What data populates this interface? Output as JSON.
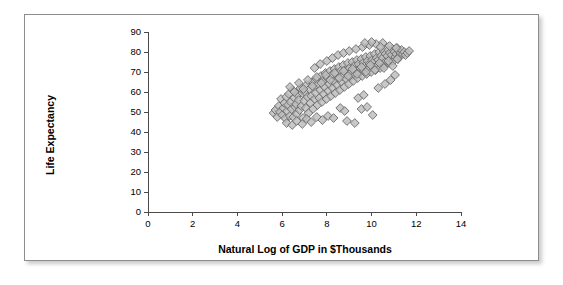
{
  "chart_data": {
    "type": "scatter",
    "title": "",
    "xlabel": "Natural Log of GDP in $Thousands",
    "ylabel": "Life Expectancy",
    "xlim": [
      0,
      14
    ],
    "ylim": [
      0,
      90
    ],
    "xticks": [
      0,
      2,
      4,
      6,
      8,
      10,
      12,
      14
    ],
    "yticks": [
      0,
      10,
      20,
      30,
      40,
      50,
      60,
      70,
      80,
      90
    ],
    "grid": false,
    "legend": null,
    "marker_style": "diamond",
    "marker_fill": "#bcbcbc",
    "marker_edge": "#6a6a6a",
    "series": [
      {
        "name": "Countries",
        "points": [
          [
            5.62,
            49.5
          ],
          [
            5.7,
            51.0
          ],
          [
            5.78,
            47.5
          ],
          [
            5.85,
            53.0
          ],
          [
            5.9,
            50.0
          ],
          [
            5.95,
            56.5
          ],
          [
            6.0,
            48.5
          ],
          [
            6.05,
            52.0
          ],
          [
            6.1,
            54.5
          ],
          [
            6.14,
            46.8
          ],
          [
            6.18,
            57.5
          ],
          [
            6.22,
            50.5
          ],
          [
            6.26,
            53.5
          ],
          [
            6.3,
            59.0
          ],
          [
            6.34,
            48.0
          ],
          [
            6.38,
            55.0
          ],
          [
            6.42,
            51.5
          ],
          [
            6.46,
            61.0
          ],
          [
            6.5,
            47.5
          ],
          [
            6.54,
            57.0
          ],
          [
            6.58,
            52.5
          ],
          [
            6.62,
            54.0
          ],
          [
            6.66,
            49.0
          ],
          [
            6.7,
            58.5
          ],
          [
            6.74,
            56.0
          ],
          [
            6.78,
            51.0
          ],
          [
            6.82,
            62.0
          ],
          [
            6.86,
            53.0
          ],
          [
            6.9,
            59.5
          ],
          [
            6.94,
            47.0
          ],
          [
            6.98,
            55.5
          ],
          [
            7.02,
            60.0
          ],
          [
            7.06,
            52.0
          ],
          [
            7.1,
            63.5
          ],
          [
            7.14,
            57.5
          ],
          [
            7.18,
            49.5
          ],
          [
            7.22,
            61.5
          ],
          [
            7.26,
            54.5
          ],
          [
            7.3,
            58.0
          ],
          [
            7.34,
            65.0
          ],
          [
            7.38,
            51.5
          ],
          [
            7.42,
            62.5
          ],
          [
            7.46,
            56.5
          ],
          [
            7.5,
            59.5
          ],
          [
            7.54,
            66.5
          ],
          [
            7.58,
            53.5
          ],
          [
            7.62,
            64.0
          ],
          [
            7.66,
            57.0
          ],
          [
            7.7,
            61.0
          ],
          [
            7.74,
            68.0
          ],
          [
            7.78,
            55.0
          ],
          [
            7.82,
            65.5
          ],
          [
            7.86,
            59.0
          ],
          [
            7.9,
            62.5
          ],
          [
            7.94,
            69.5
          ],
          [
            7.98,
            56.5
          ],
          [
            8.02,
            67.0
          ],
          [
            8.06,
            60.5
          ],
          [
            8.1,
            64.0
          ],
          [
            8.14,
            70.5
          ],
          [
            8.18,
            58.0
          ],
          [
            8.22,
            68.5
          ],
          [
            8.26,
            62.0
          ],
          [
            8.3,
            65.5
          ],
          [
            8.34,
            71.5
          ],
          [
            8.38,
            59.5
          ],
          [
            8.42,
            69.5
          ],
          [
            8.46,
            63.5
          ],
          [
            8.5,
            67.0
          ],
          [
            8.54,
            72.5
          ],
          [
            8.58,
            61.0
          ],
          [
            8.62,
            70.5
          ],
          [
            8.66,
            65.0
          ],
          [
            8.7,
            68.0
          ],
          [
            8.74,
            73.5
          ],
          [
            8.78,
            62.5
          ],
          [
            8.82,
            71.0
          ],
          [
            8.86,
            66.5
          ],
          [
            8.9,
            69.0
          ],
          [
            8.94,
            74.5
          ],
          [
            8.98,
            64.0
          ],
          [
            9.02,
            72.0
          ],
          [
            9.06,
            67.5
          ],
          [
            9.1,
            70.0
          ],
          [
            9.14,
            75.0
          ],
          [
            9.18,
            65.5
          ],
          [
            9.22,
            73.0
          ],
          [
            9.26,
            68.5
          ],
          [
            9.3,
            71.0
          ],
          [
            9.34,
            76.0
          ],
          [
            9.38,
            67.0
          ],
          [
            9.42,
            74.0
          ],
          [
            9.46,
            69.5
          ],
          [
            9.5,
            72.0
          ],
          [
            9.54,
            76.5
          ],
          [
            9.58,
            68.0
          ],
          [
            9.62,
            74.5
          ],
          [
            9.66,
            70.5
          ],
          [
            9.7,
            73.0
          ],
          [
            9.74,
            77.5
          ],
          [
            9.78,
            69.0
          ],
          [
            9.82,
            75.5
          ],
          [
            9.86,
            71.5
          ],
          [
            9.9,
            74.0
          ],
          [
            9.94,
            78.0
          ],
          [
            9.98,
            70.0
          ],
          [
            10.02,
            76.0
          ],
          [
            10.06,
            72.5
          ],
          [
            10.1,
            75.0
          ],
          [
            10.14,
            79.0
          ],
          [
            10.18,
            71.0
          ],
          [
            10.22,
            77.0
          ],
          [
            10.26,
            73.5
          ],
          [
            10.3,
            76.0
          ],
          [
            10.34,
            80.0
          ],
          [
            10.38,
            72.0
          ],
          [
            10.42,
            78.0
          ],
          [
            10.46,
            74.5
          ],
          [
            10.5,
            77.0
          ],
          [
            10.54,
            80.5
          ],
          [
            10.58,
            73.5
          ],
          [
            10.62,
            79.0
          ],
          [
            10.66,
            75.5
          ],
          [
            10.7,
            78.0
          ],
          [
            10.74,
            81.0
          ],
          [
            10.78,
            74.5
          ],
          [
            10.82,
            79.5
          ],
          [
            10.86,
            76.5
          ],
          [
            10.9,
            78.5
          ],
          [
            10.94,
            81.5
          ],
          [
            10.98,
            75.5
          ],
          [
            11.02,
            80.0
          ],
          [
            11.06,
            77.5
          ],
          [
            11.1,
            79.0
          ],
          [
            11.14,
            82.0
          ],
          [
            11.18,
            76.5
          ],
          [
            11.22,
            80.5
          ],
          [
            11.26,
            78.0
          ],
          [
            11.3,
            79.5
          ],
          [
            11.34,
            81.0
          ],
          [
            11.4,
            79.0
          ],
          [
            11.46,
            80.0
          ],
          [
            11.52,
            78.5
          ],
          [
            11.6,
            79.5
          ],
          [
            11.68,
            80.5
          ],
          [
            6.35,
            62.5
          ],
          [
            6.55,
            60.0
          ],
          [
            6.75,
            64.5
          ],
          [
            6.95,
            61.5
          ],
          [
            7.15,
            66.0
          ],
          [
            7.35,
            63.0
          ],
          [
            7.55,
            67.5
          ],
          [
            7.75,
            64.5
          ],
          [
            7.95,
            68.5
          ],
          [
            8.15,
            66.0
          ],
          [
            8.35,
            69.5
          ],
          [
            8.55,
            67.0
          ],
          [
            8.75,
            70.5
          ],
          [
            8.95,
            68.0
          ],
          [
            9.15,
            71.5
          ],
          [
            9.35,
            69.0
          ],
          [
            9.55,
            72.5
          ],
          [
            9.75,
            70.0
          ],
          [
            9.95,
            73.5
          ],
          [
            10.15,
            71.0
          ],
          [
            10.35,
            74.5
          ],
          [
            10.55,
            72.0
          ],
          [
            10.75,
            75.5
          ],
          [
            10.95,
            73.0
          ],
          [
            11.15,
            76.5
          ],
          [
            6.2,
            44.5
          ],
          [
            6.45,
            43.5
          ],
          [
            6.65,
            45.5
          ],
          [
            6.9,
            44.0
          ],
          [
            7.1,
            46.5
          ],
          [
            7.3,
            45.0
          ],
          [
            7.55,
            47.5
          ],
          [
            7.8,
            46.0
          ],
          [
            8.05,
            48.0
          ],
          [
            8.3,
            47.0
          ],
          [
            8.9,
            45.5
          ],
          [
            9.25,
            44.5
          ],
          [
            9.55,
            51.5
          ],
          [
            9.8,
            52.5
          ],
          [
            10.05,
            48.5
          ],
          [
            8.6,
            52.0
          ],
          [
            8.8,
            50.5
          ],
          [
            9.4,
            57.0
          ],
          [
            9.65,
            58.5
          ],
          [
            10.3,
            62.0
          ],
          [
            10.6,
            64.0
          ],
          [
            10.85,
            66.0
          ],
          [
            11.05,
            68.5
          ],
          [
            7.45,
            72.0
          ],
          [
            7.7,
            74.0
          ],
          [
            8.0,
            75.5
          ],
          [
            8.25,
            77.0
          ],
          [
            8.5,
            78.5
          ],
          [
            8.75,
            79.5
          ],
          [
            9.0,
            80.5
          ],
          [
            9.3,
            81.5
          ],
          [
            9.6,
            82.5
          ],
          [
            9.9,
            83.5
          ],
          [
            10.2,
            84.0
          ],
          [
            10.5,
            84.5
          ],
          [
            10.8,
            83.0
          ],
          [
            11.1,
            82.0
          ],
          [
            10.0,
            85.0
          ],
          [
            9.7,
            84.5
          ],
          [
            10.4,
            82.5
          ]
        ]
      }
    ]
  }
}
